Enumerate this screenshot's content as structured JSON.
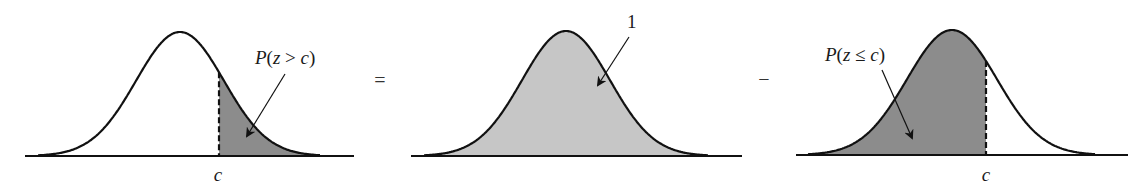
{
  "figure": {
    "equation": "P(z > c) = 1 - P(z ≤ c)",
    "operators": {
      "equals": "=",
      "minus": "−"
    },
    "colors": {
      "dark_shade": "#8c8c8c",
      "light_shade": "#c6c6c6",
      "stroke": "#111111",
      "background": "#ffffff"
    },
    "panels": [
      {
        "id": "left",
        "label": "P(z > c)",
        "label_parts": {
          "p": "P",
          "open": "(",
          "var": "z",
          "rel": " > ",
          "c": "c",
          "close": ")"
        },
        "axis_label": "c",
        "shaded_region": "right tail beyond c",
        "baseline": {
          "x1": 25,
          "x2": 354,
          "y": 156
        },
        "curve": {
          "mu": 180,
          "sigma": 44,
          "peak_y": 32,
          "x_from": 38,
          "x_to": 320
        },
        "cut_x": 219,
        "shade": "dark",
        "arrow": {
          "x1": 285,
          "y1": 74,
          "x2": 247,
          "y2": 136
        },
        "label_pos": {
          "x": 255,
          "y": 64
        },
        "axis_label_pos": {
          "x": 218,
          "y": 181
        }
      },
      {
        "id": "middle",
        "label": "1",
        "shaded_region": "entire area under curve",
        "baseline": {
          "x1": 411,
          "x2": 742,
          "y": 156
        },
        "curve": {
          "mu": 566,
          "sigma": 44,
          "peak_y": 31,
          "x_from": 424,
          "x_to": 708
        },
        "shade": "light",
        "arrow": {
          "x1": 629,
          "y1": 37,
          "x2": 598,
          "y2": 85
        },
        "label_pos": {
          "x": 627,
          "y": 28
        }
      },
      {
        "id": "right",
        "label": "P(z ≤ c)",
        "label_parts": {
          "p": "P",
          "open": "(",
          "var": "z",
          "rel": " ≤ ",
          "c": "c",
          "close": ")"
        },
        "axis_label": "c",
        "shaded_region": "left area up to c",
        "baseline": {
          "x1": 796,
          "x2": 1128,
          "y": 155
        },
        "curve": {
          "mu": 952,
          "sigma": 45,
          "peak_y": 30,
          "x_from": 808,
          "x_to": 1095
        },
        "cut_x": 986,
        "shade": "dark",
        "arrow": {
          "x1": 882,
          "y1": 70,
          "x2": 912,
          "y2": 138
        },
        "label_pos": {
          "x": 825,
          "y": 61
        },
        "axis_label_pos": {
          "x": 986,
          "y": 181
        }
      }
    ],
    "operator_pos": {
      "equals": {
        "x": 380,
        "y": 87
      },
      "minus": {
        "x": 764,
        "y": 86
      }
    }
  }
}
